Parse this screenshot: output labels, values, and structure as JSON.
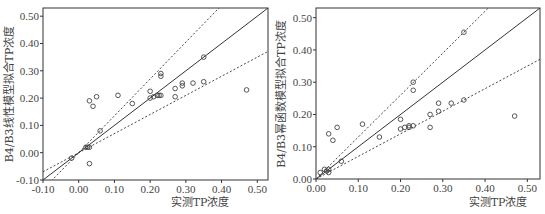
{
  "chart_data": [
    {
      "type": "scatter",
      "title": "",
      "xlabel": "实测TP浓度",
      "ylabel": "B4/B3线性模型拟合TP浓度",
      "xlim": [
        -0.1,
        0.53
      ],
      "ylim": [
        -0.1,
        0.53
      ],
      "xticks": [
        "-0.10",
        "0.00",
        "0.10",
        "0.20",
        "0.30",
        "0.40",
        "0.50"
      ],
      "yticks": [
        "-0.10",
        "0.00",
        "0.10",
        "0.20",
        "0.30",
        "0.40",
        "0.50"
      ],
      "grid": false,
      "legend": null,
      "lines": [
        {
          "name": "1:1 line",
          "style": "solid",
          "slope": 1.0,
          "intercept": 0.0
        },
        {
          "name": "upper bound",
          "style": "dashed",
          "slope": 1.35,
          "intercept": 0.0
        },
        {
          "name": "lower bound",
          "style": "dashed",
          "slope": 0.7,
          "intercept": 0.0
        }
      ],
      "points": [
        {
          "x": -0.02,
          "y": -0.02
        },
        {
          "x": 0.02,
          "y": 0.02
        },
        {
          "x": 0.025,
          "y": 0.02
        },
        {
          "x": 0.03,
          "y": 0.02
        },
        {
          "x": 0.03,
          "y": -0.04
        },
        {
          "x": 0.03,
          "y": 0.19
        },
        {
          "x": 0.04,
          "y": 0.17
        },
        {
          "x": 0.05,
          "y": 0.205
        },
        {
          "x": 0.06,
          "y": 0.08
        },
        {
          "x": 0.11,
          "y": 0.21
        },
        {
          "x": 0.15,
          "y": 0.18
        },
        {
          "x": 0.2,
          "y": 0.2
        },
        {
          "x": 0.2,
          "y": 0.225
        },
        {
          "x": 0.21,
          "y": 0.205
        },
        {
          "x": 0.22,
          "y": 0.21
        },
        {
          "x": 0.225,
          "y": 0.21
        },
        {
          "x": 0.23,
          "y": 0.21
        },
        {
          "x": 0.23,
          "y": 0.28
        },
        {
          "x": 0.23,
          "y": 0.29
        },
        {
          "x": 0.27,
          "y": 0.205
        },
        {
          "x": 0.27,
          "y": 0.235
        },
        {
          "x": 0.29,
          "y": 0.245
        },
        {
          "x": 0.29,
          "y": 0.255
        },
        {
          "x": 0.32,
          "y": 0.255
        },
        {
          "x": 0.35,
          "y": 0.26
        },
        {
          "x": 0.35,
          "y": 0.35
        },
        {
          "x": 0.47,
          "y": 0.23
        }
      ]
    },
    {
      "type": "scatter",
      "title": "",
      "xlabel": "实测TP浓度",
      "ylabel": "B4/B3幂函数模型拟合TP浓度",
      "xlim": [
        0.0,
        0.53
      ],
      "ylim": [
        0.0,
        0.53
      ],
      "xticks": [
        "0.00",
        "0.10",
        "0.20",
        "0.30",
        "0.40",
        "0.50"
      ],
      "yticks": [
        "0.00",
        "0.10",
        "0.20",
        "0.30",
        "0.40",
        "0.50"
      ],
      "grid": false,
      "legend": null,
      "lines": [
        {
          "name": "1:1 line",
          "style": "solid",
          "slope": 1.0,
          "intercept": 0.0
        },
        {
          "name": "upper bound",
          "style": "dashed",
          "slope": 1.3,
          "intercept": 0.0
        },
        {
          "name": "lower bound",
          "style": "dashed",
          "slope": 0.7,
          "intercept": 0.0
        }
      ],
      "points": [
        {
          "x": 0.01,
          "y": 0.02
        },
        {
          "x": 0.02,
          "y": 0.03
        },
        {
          "x": 0.025,
          "y": 0.025
        },
        {
          "x": 0.03,
          "y": 0.02
        },
        {
          "x": 0.03,
          "y": 0.03
        },
        {
          "x": 0.03,
          "y": 0.14
        },
        {
          "x": 0.04,
          "y": 0.12
        },
        {
          "x": 0.05,
          "y": 0.16
        },
        {
          "x": 0.06,
          "y": 0.055
        },
        {
          "x": 0.11,
          "y": 0.17
        },
        {
          "x": 0.15,
          "y": 0.13
        },
        {
          "x": 0.2,
          "y": 0.155
        },
        {
          "x": 0.2,
          "y": 0.185
        },
        {
          "x": 0.21,
          "y": 0.16
        },
        {
          "x": 0.22,
          "y": 0.16
        },
        {
          "x": 0.22,
          "y": 0.165
        },
        {
          "x": 0.23,
          "y": 0.165
        },
        {
          "x": 0.23,
          "y": 0.275
        },
        {
          "x": 0.23,
          "y": 0.3
        },
        {
          "x": 0.27,
          "y": 0.16
        },
        {
          "x": 0.27,
          "y": 0.2
        },
        {
          "x": 0.29,
          "y": 0.21
        },
        {
          "x": 0.29,
          "y": 0.235
        },
        {
          "x": 0.32,
          "y": 0.235
        },
        {
          "x": 0.35,
          "y": 0.245
        },
        {
          "x": 0.35,
          "y": 0.455
        },
        {
          "x": 0.47,
          "y": 0.195
        }
      ]
    }
  ],
  "left": {
    "xlabel": "实测TP浓度",
    "ylabel": "B4/B3线性模型拟合TP浓度",
    "xticks": [
      "-0.10",
      "0.00",
      "0.10",
      "0.20",
      "0.30",
      "0.40",
      "0.50"
    ],
    "yticks": [
      "-0.10",
      "0.00",
      "0.10",
      "0.20",
      "0.30",
      "0.40",
      "0.50"
    ]
  },
  "right": {
    "xlabel": "实测TP浓度",
    "ylabel": "B4/B3幂函数模型拟合TP浓度",
    "xticks": [
      "0.00",
      "0.10",
      "0.20",
      "0.30",
      "0.40",
      "0.50"
    ],
    "yticks": [
      "0.00",
      "0.10",
      "0.20",
      "0.30",
      "0.40",
      "0.50"
    ]
  }
}
